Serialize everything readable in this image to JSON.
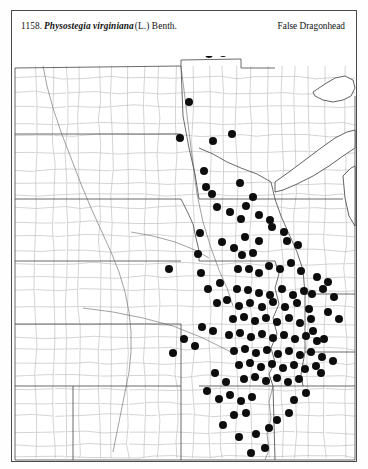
{
  "plate": {
    "number": "1158.",
    "scientific_name": "Physostegia virginiana",
    "authority": "(L.) Benth.",
    "common_name": "False Dragonhead"
  },
  "map": {
    "type": "dot-distribution-map",
    "region": "Great Plains and Midwest, United States",
    "symbol": "filled-circle",
    "symbol_meaning": "county occurrence record",
    "boundaries": "county and state outlines",
    "colors": {
      "dot": "#0d0d0d",
      "county_line": "#8d8d8d",
      "state_line": "#3a3a3a",
      "background": "#ffffff",
      "frame": "#4a4a4a"
    },
    "dot_radius": 4.0,
    "dot_count": 131,
    "dots": [
      [
        214,
        30
      ],
      [
        223,
        40
      ],
      [
        208,
        53
      ],
      [
        222,
        52
      ],
      [
        188,
        101
      ],
      [
        179,
        137
      ],
      [
        212,
        140
      ],
      [
        231,
        133
      ],
      [
        203,
        170
      ],
      [
        205,
        186
      ],
      [
        211,
        193
      ],
      [
        239,
        182
      ],
      [
        199,
        232
      ],
      [
        197,
        253
      ],
      [
        200,
        272
      ],
      [
        168,
        268
      ],
      [
        207,
        288
      ],
      [
        219,
        282
      ],
      [
        221,
        241
      ],
      [
        233,
        247
      ],
      [
        241,
        254
      ],
      [
        252,
        252
      ],
      [
        244,
        236
      ],
      [
        258,
        240
      ],
      [
        237,
        268
      ],
      [
        248,
        268
      ],
      [
        258,
        272
      ],
      [
        268,
        265
      ],
      [
        279,
        268
      ],
      [
        290,
        262
      ],
      [
        300,
        270
      ],
      [
        236,
        288
      ],
      [
        247,
        289
      ],
      [
        258,
        292
      ],
      [
        269,
        294
      ],
      [
        281,
        288
      ],
      [
        292,
        294
      ],
      [
        303,
        290
      ],
      [
        216,
        302
      ],
      [
        226,
        299
      ],
      [
        238,
        305
      ],
      [
        249,
        302
      ],
      [
        261,
        306
      ],
      [
        272,
        301
      ],
      [
        284,
        306
      ],
      [
        296,
        302
      ],
      [
        308,
        308
      ],
      [
        232,
        318
      ],
      [
        243,
        316
      ],
      [
        254,
        320
      ],
      [
        265,
        317
      ],
      [
        276,
        321
      ],
      [
        288,
        317
      ],
      [
        299,
        322
      ],
      [
        310,
        318
      ],
      [
        228,
        334
      ],
      [
        239,
        332
      ],
      [
        250,
        336
      ],
      [
        261,
        333
      ],
      [
        272,
        337
      ],
      [
        283,
        334
      ],
      [
        294,
        338
      ],
      [
        305,
        335
      ],
      [
        316,
        340
      ],
      [
        233,
        350
      ],
      [
        244,
        348
      ],
      [
        255,
        352
      ],
      [
        266,
        349
      ],
      [
        277,
        353
      ],
      [
        288,
        350
      ],
      [
        299,
        354
      ],
      [
        310,
        351
      ],
      [
        321,
        356
      ],
      [
        238,
        364
      ],
      [
        249,
        362
      ],
      [
        260,
        366
      ],
      [
        271,
        363
      ],
      [
        282,
        367
      ],
      [
        293,
        364
      ],
      [
        304,
        368
      ],
      [
        315,
        365
      ],
      [
        243,
        378
      ],
      [
        254,
        376
      ],
      [
        265,
        380
      ],
      [
        276,
        377
      ],
      [
        287,
        381
      ],
      [
        298,
        378
      ],
      [
        225,
        381
      ],
      [
        214,
        372
      ],
      [
        206,
        390
      ],
      [
        218,
        398
      ],
      [
        229,
        394
      ],
      [
        240,
        400
      ],
      [
        251,
        396
      ],
      [
        233,
        414
      ],
      [
        245,
        412
      ],
      [
        222,
        424
      ],
      [
        238,
        436
      ],
      [
        255,
        433
      ],
      [
        268,
        427
      ],
      [
        194,
        345
      ],
      [
        183,
        338
      ],
      [
        172,
        352
      ],
      [
        212,
        330
      ],
      [
        201,
        326
      ],
      [
        311,
        293
      ],
      [
        322,
        288
      ],
      [
        333,
        296
      ],
      [
        327,
        311
      ],
      [
        338,
        318
      ],
      [
        316,
        276
      ],
      [
        327,
        281
      ],
      [
        286,
        240
      ],
      [
        297,
        244
      ],
      [
        271,
        226
      ],
      [
        283,
        231
      ],
      [
        258,
        214
      ],
      [
        269,
        219
      ],
      [
        245,
        205
      ],
      [
        252,
        196
      ],
      [
        229,
        211
      ],
      [
        240,
        218
      ],
      [
        216,
        206
      ],
      [
        312,
        330
      ],
      [
        323,
        338
      ],
      [
        305,
        392
      ],
      [
        293,
        399
      ],
      [
        332,
        360
      ],
      [
        320,
        372
      ],
      [
        264,
        447
      ],
      [
        250,
        452
      ],
      [
        288,
        412
      ],
      [
        276,
        419
      ]
    ]
  }
}
